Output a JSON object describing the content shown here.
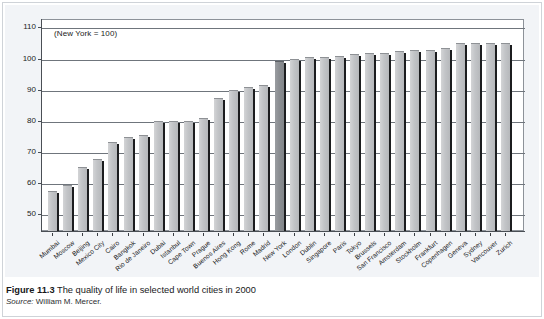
{
  "figure": {
    "caption_label": "Figure 11.3",
    "caption_text": "The quality of life in selected world cities in 2000",
    "source_label": "Source:",
    "source_text": "William M. Mercer."
  },
  "chart_data": {
    "type": "bar",
    "title": "The quality of life in selected world cities in 2000",
    "annotation": "(New York = 100)",
    "xlabel": "",
    "ylabel": "",
    "ylim": [
      45,
      113
    ],
    "grid": true,
    "legend": false,
    "yticks": [
      50,
      60,
      70,
      80,
      90,
      100,
      110
    ],
    "ytick_labels": [
      "50",
      "60",
      "70",
      "80",
      "90",
      "100",
      "110"
    ],
    "highlight_category": "New York",
    "highlight_color": "#8b8e92",
    "bar_color": "#c2c4c7",
    "categories": [
      "Mumbai",
      "Moscow",
      "Beijing",
      "Mexico City",
      "Cairo",
      "Bangkok",
      "Rio de Janeiro",
      "Dubai",
      "Istanbul",
      "Cape Town",
      "Prague",
      "Buenos Aires",
      "Hong Kong",
      "Rome",
      "Madrid",
      "New York",
      "London",
      "Dublin",
      "Singapore",
      "Paris",
      "Tokyo",
      "Brussels",
      "San Francisco",
      "Amsterdam",
      "Stockholm",
      "Frankfurt",
      "Copenhagen",
      "Geneva",
      "Sydney",
      "Vancouver",
      "Zurich"
    ],
    "values": [
      58,
      60,
      66,
      68.5,
      74,
      75.5,
      76,
      80.5,
      80.5,
      80.5,
      81.5,
      88,
      90.5,
      91.5,
      92,
      100,
      100.5,
      101,
      101,
      101.5,
      102,
      102.5,
      102.5,
      103,
      103.5,
      103.5,
      104,
      105.5,
      105.5,
      105.5,
      105.5
    ]
  }
}
